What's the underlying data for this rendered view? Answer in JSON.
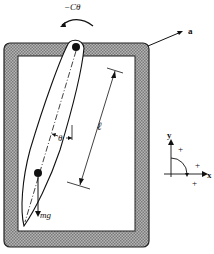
{
  "diagram": {
    "type": "pendulum-in-frame",
    "labels": {
      "torque": "−Cθ",
      "frame": "a",
      "angle": "θ",
      "length": "ℓ",
      "weight": "mg",
      "axis_y": "y",
      "axis_x": "x",
      "plus": "+"
    },
    "colors": {
      "frame_fill": "#9a9a9a",
      "line": "#111111",
      "background": "#ffffff"
    }
  }
}
